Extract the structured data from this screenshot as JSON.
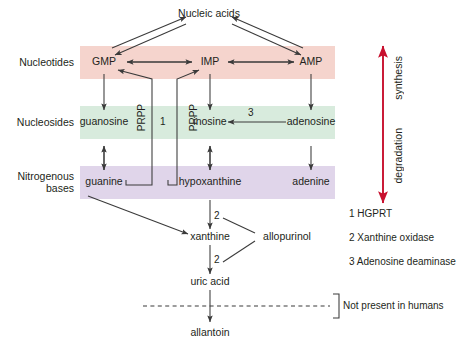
{
  "figure": {
    "bands": [
      {
        "name": "nucleotides",
        "label": "Nucleotides",
        "color": "#f5d4cd",
        "y": 62
      },
      {
        "name": "nucleosides",
        "label": "Nucleosides",
        "color": "#d8ebdd",
        "y": 122
      },
      {
        "name": "nitrogenous-bases",
        "label": "Nitrogenous\nbases",
        "label_line1": "Nitrogenous",
        "label_line2": "bases",
        "color": "#e0d5ea",
        "y": 182
      }
    ],
    "nodes": {
      "nucleic_acids": "Nucleic acids",
      "gmp": "GMP",
      "imp": "IMP",
      "amp": "AMP",
      "guanosine": "guanosine",
      "inosine": "inosine",
      "adenosine": "adenosine",
      "guanine": "guanine",
      "hypoxanthine": "hypoxanthine",
      "adenine": "adenine",
      "xanthine": "xanthine",
      "uric_acid": "uric acid",
      "allantoin": "allantoin",
      "allopurinol": "allopurinol"
    },
    "edge_labels": {
      "prpp_left": "PRPP",
      "prpp_right": "PRPP",
      "hgprt_number": "1",
      "ada_number": "3",
      "xo_number_upper": "2",
      "xo_number_lower": "2"
    },
    "axis": {
      "synthesis": "synthesis",
      "degradation": "degradation",
      "arrow_color": "#c8102e"
    },
    "annotations": {
      "not_present": "Not present in humans"
    },
    "legend": [
      {
        "number": "1",
        "text": "HGPRT",
        "full": "1 HGPRT"
      },
      {
        "number": "2",
        "text": "Xanthine oxidase",
        "full": "2 Xanthine oxidase"
      },
      {
        "number": "3",
        "text": "Adenosine deaminase",
        "full": "3 Adenosine deaminase"
      }
    ]
  }
}
